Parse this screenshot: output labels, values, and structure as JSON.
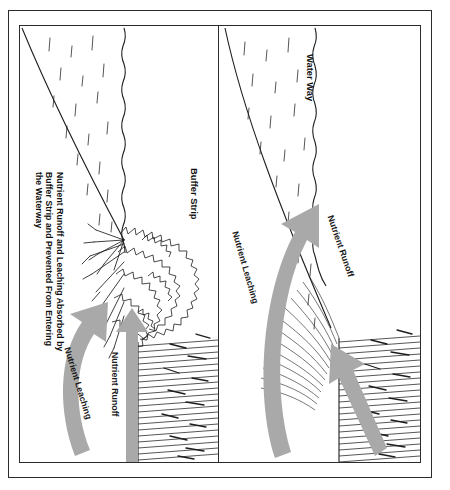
{
  "diagram": {
    "orientation": "rotated-90",
    "colors": {
      "ink": "#1d1d1d",
      "arrow_gray": "#a9a9a9",
      "background": "#ffffff"
    }
  },
  "panels": [
    {
      "id": "buffered",
      "name": "with-buffer-strip",
      "labels": {
        "buffer_strip": "Buffer Strip",
        "absorbed_note": "Nutrient Runoff and Leaching Absorbed by Buffer Strip and Prevented From Entering the Waterway"
      },
      "arrows": [
        {
          "name": "nutrient-leaching-arrow",
          "label": "Nutrient Leaching",
          "shape": "curved",
          "direction": "up-into-buffer"
        },
        {
          "name": "nutrient-runoff-arrow",
          "label": "Nutrient Runoff",
          "shape": "straight",
          "direction": "up-into-buffer"
        }
      ],
      "features": [
        "waterway",
        "buffer-strip-vegetation",
        "crop-field"
      ]
    },
    {
      "id": "unbuffered",
      "name": "without-buffer-strip",
      "labels": {
        "water_way": "Water Way"
      },
      "arrows": [
        {
          "name": "nutrient-leaching-arrow",
          "label": "Nutrient Leaching",
          "shape": "curved",
          "direction": "into-waterway"
        },
        {
          "name": "nutrient-runoff-arrow",
          "label": "Nutrient Runoff",
          "shape": "diagonal",
          "direction": "into-waterway"
        }
      ],
      "features": [
        "waterway",
        "bare-bank",
        "crop-field"
      ]
    }
  ]
}
